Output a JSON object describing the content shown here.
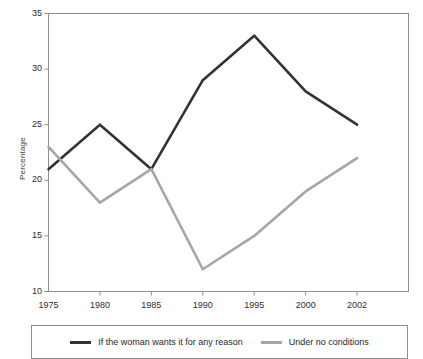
{
  "chart_data": {
    "type": "line",
    "title": "",
    "subtitle": "",
    "xlabel": "",
    "ylabel": "Percentage",
    "x": [
      1975,
      1980,
      1985,
      1990,
      1995,
      2000,
      2002
    ],
    "categories": [
      "1975",
      "1980",
      "1985",
      "1990",
      "1995",
      "2000",
      "2002"
    ],
    "xtick_labels": [
      "1975",
      "1980",
      "1985",
      "1990",
      "1995",
      "2000",
      "2002"
    ],
    "ytick_labels": [
      "35",
      "30",
      "25",
      "20",
      "15",
      "10"
    ],
    "ytick_values": [
      35,
      30,
      25,
      20,
      15,
      10
    ],
    "ylim": [
      10,
      35
    ],
    "xlim": [
      1975,
      2002
    ],
    "grid": false,
    "legend_position": "bottom",
    "series": [
      {
        "name": "If the woman wants it for any reason",
        "color": "#333333",
        "values": [
          21,
          25,
          21,
          29,
          33,
          28,
          25
        ]
      },
      {
        "name": "Under no conditions",
        "color": "#a6a6a6",
        "values": [
          23,
          18,
          21,
          12,
          15,
          19,
          22
        ]
      }
    ]
  },
  "legend": {
    "entries": [
      {
        "label": "If the woman wants it for any reason",
        "color": "#333333"
      },
      {
        "label": "Under no conditions",
        "color": "#a6a6a6"
      }
    ]
  },
  "axes": {
    "y_title": "Percentage"
  }
}
